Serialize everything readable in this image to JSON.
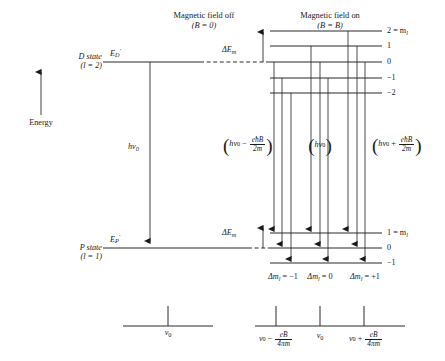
{
  "figure": {
    "title_off": "Magnetic field off",
    "cond_off": "(B = 0)",
    "title_on": "Magnetic field on",
    "cond_on": "(B = B)",
    "energy_axis_label": "Energy"
  },
  "states": {
    "upper": {
      "name": "D state",
      "quantum": "(l = 2)",
      "energy_label": "E",
      "energy_sub": "D",
      "energy_prime": "′"
    },
    "lower": {
      "name": "P state",
      "quantum": "(l = 1)",
      "energy_label": "E",
      "energy_sub": "P",
      "energy_prime": "′"
    }
  },
  "splitting": {
    "delta_label": "ΔE",
    "delta_sub": "m",
    "upper_ml": [
      "2 = m",
      "1",
      "0",
      "−1",
      "−2"
    ],
    "upper_ml_sub": "l",
    "lower_ml": [
      "1 = m",
      "0",
      "−1"
    ],
    "lower_ml_sub": "l"
  },
  "photons": {
    "center_unsplit": "hν",
    "center_unsplit_sub": "0",
    "left_group": {
      "open": "(",
      "h": "h",
      "nu": "ν",
      "nu_sub": "0",
      "op": "−",
      "num": "eħB",
      "den": "2m",
      "close": ")"
    },
    "mid_group": {
      "open": "(",
      "h": "h",
      "nu": "ν",
      "nu_sub": "0",
      "close": ")"
    },
    "right_group": {
      "open": "(",
      "h": "h",
      "nu": "ν",
      "nu_sub": "0",
      "op": "+",
      "num": "eħB",
      "den": "2m",
      "close": ")"
    }
  },
  "selection_rules": [
    {
      "text": "Δm",
      "sub": "l",
      "value": " = −1"
    },
    {
      "text": "Δm",
      "sub": "l",
      "value": " = 0"
    },
    {
      "text": "Δm",
      "sub": "l",
      "value": " = +1"
    }
  ],
  "spectrum": {
    "unsplit": {
      "nu": "ν",
      "nu_sub": "0"
    },
    "split": [
      {
        "nu": "ν",
        "nu_sub": "0",
        "op": "−",
        "num": "eB",
        "den": "4πm"
      },
      {
        "nu": "ν",
        "nu_sub": "0",
        "op": "",
        "num": "",
        "den": ""
      },
      {
        "nu": "ν",
        "nu_sub": "0",
        "op": "+",
        "num": "eB",
        "den": "4πm"
      }
    ]
  },
  "colors": {
    "ink": "#1a1a1a",
    "background": "#ffffff"
  }
}
